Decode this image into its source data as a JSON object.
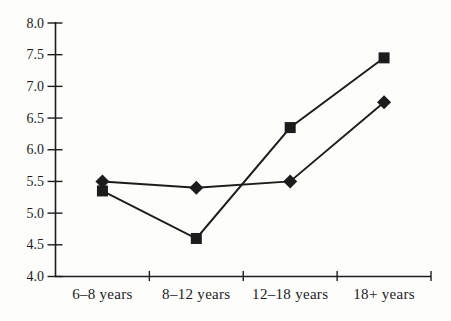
{
  "page": {
    "background": "#fdfdfc",
    "ink_color": "#1c1c1c"
  },
  "chart_data": {
    "type": "line",
    "title": "",
    "xlabel": "",
    "ylabel": "",
    "categories": [
      "6–8 years",
      "8–12 years",
      "12–18 years",
      "18+ years"
    ],
    "series": [
      {
        "name": "square-series",
        "marker": "square",
        "color": "#1c1c1c",
        "values": [
          5.35,
          4.6,
          6.35,
          7.45
        ]
      },
      {
        "name": "diamond-series",
        "marker": "diamond",
        "color": "#1c1c1c",
        "values": [
          5.5,
          5.4,
          5.5,
          6.75
        ]
      }
    ],
    "ylim": [
      4.0,
      8.0
    ],
    "ytick_step": 0.5,
    "ytick_labels": [
      "4.0",
      "4.5",
      "5.0",
      "5.5",
      "6.0",
      "6.5",
      "7.0",
      "7.5",
      "8.0"
    ],
    "grid": false,
    "legend": "none"
  }
}
